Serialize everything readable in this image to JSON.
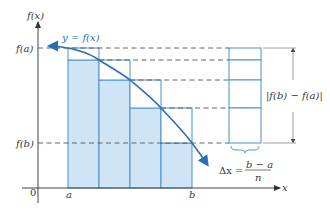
{
  "diagram": {
    "type": "left-endpoint approximation / monotone function error bound",
    "colors": {
      "curve": "#2a6fb5",
      "rect_fill": "#cfe4f5",
      "rect_stroke": "#4a8fcf",
      "axis": "#444444",
      "dashed": "#555555",
      "text": "#3a3a3a"
    },
    "axes": {
      "y_label": "f(x)",
      "x_label": "x",
      "origin_label": "0"
    },
    "ticks": {
      "x": [
        {
          "label": "a",
          "x": 68
        },
        {
          "label": "b",
          "x": 192
        }
      ],
      "y": [
        {
          "label": "f(a)",
          "y": 48
        },
        {
          "label": "f(b)",
          "y": 143
        }
      ]
    },
    "curve_label": "y = f(x)",
    "rectangles": [
      {
        "x0": 68,
        "x1": 99,
        "top": 48,
        "outer": true
      },
      {
        "x0": 68,
        "x1": 99,
        "top": 60
      },
      {
        "x0": 99,
        "x1": 130,
        "top": 80
      },
      {
        "x0": 130,
        "x1": 161,
        "top": 108
      },
      {
        "x0": 161,
        "x1": 192,
        "top": 143
      }
    ],
    "stack": {
      "x0": 229,
      "x1": 261,
      "levels": [
        48,
        60,
        80,
        108,
        143
      ]
    },
    "difference_label": "|f(b) − f(a)|",
    "delta_label": {
      "lhs": "Δx =",
      "numerator": "b − a",
      "denominator": "n"
    }
  }
}
